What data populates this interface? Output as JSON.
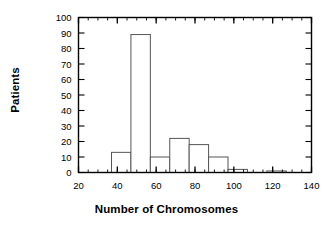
{
  "chart_data": {
    "type": "bar",
    "title": "",
    "subtitle": "",
    "xlabel": "Number of Chromosomes",
    "ylabel": "Patients",
    "xlim": [
      20,
      140
    ],
    "ylim": [
      0,
      100
    ],
    "xticks": [
      20,
      40,
      60,
      80,
      100,
      120,
      140
    ],
    "xtick_labels": [
      "20",
      "40",
      "60",
      "80",
      "100",
      "120",
      "140"
    ],
    "x_minor_tick_step": 5,
    "yticks": [
      0,
      10,
      20,
      30,
      40,
      50,
      60,
      70,
      80,
      90,
      100
    ],
    "ytick_labels": [
      "0",
      "10",
      "20",
      "30",
      "40",
      "50",
      "60",
      "70",
      "80",
      "90",
      "100"
    ],
    "grid": false,
    "legend": false,
    "legend_position": "none",
    "bin_width": 10,
    "bin_edges": [
      37,
      47,
      57,
      67,
      77,
      87,
      97,
      107,
      117,
      127
    ],
    "categories": [
      "37-47",
      "47-57",
      "57-67",
      "67-77",
      "77-87",
      "87-97",
      "97-107",
      "107-117",
      "117-127"
    ],
    "values": [
      13,
      89,
      10,
      22,
      18,
      10,
      2,
      0,
      1
    ],
    "bars": [
      {
        "start": 37,
        "end": 47,
        "value": 13
      },
      {
        "start": 47,
        "end": 57,
        "value": 89
      },
      {
        "start": 57,
        "end": 67,
        "value": 10
      },
      {
        "start": 67,
        "end": 77,
        "value": 22
      },
      {
        "start": 77,
        "end": 87,
        "value": 18
      },
      {
        "start": 87,
        "end": 97,
        "value": 10
      },
      {
        "start": 97,
        "end": 107,
        "value": 2
      },
      {
        "start": 107,
        "end": 117,
        "value": 0
      },
      {
        "start": 117,
        "end": 127,
        "value": 1
      }
    ],
    "bar_fill_color": "#ffffff",
    "bar_edge_color": "#555555",
    "axis_color": "#000000",
    "background_color": "#ffffff"
  }
}
